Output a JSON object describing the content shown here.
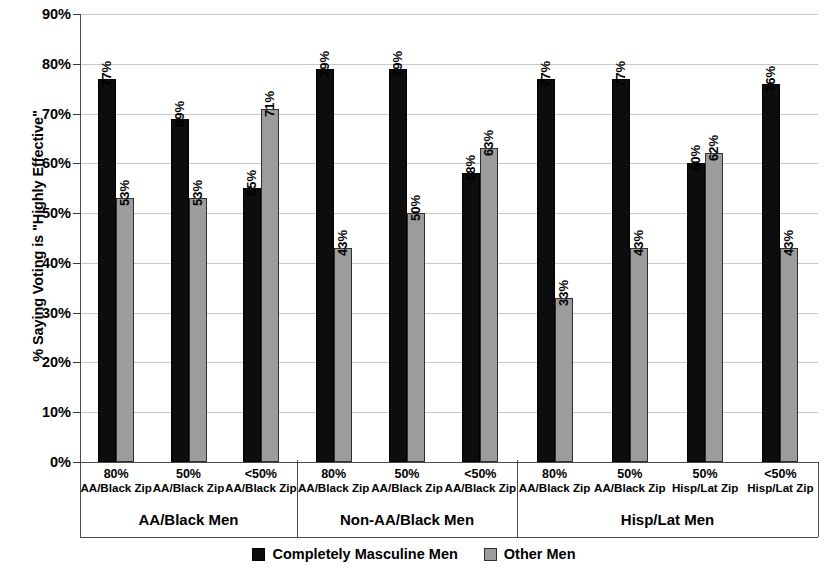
{
  "chart_data": {
    "type": "bar",
    "title": "",
    "xlabel": "",
    "ylabel": "% Saying Voting is \"Highly Effective\"",
    "ylim": [
      0,
      90
    ],
    "ytick_labels": [
      "0%",
      "10%",
      "20%",
      "30%",
      "40%",
      "50%",
      "60%",
      "70%",
      "80%",
      "90%"
    ],
    "ytick_values": [
      0,
      10,
      20,
      30,
      40,
      50,
      60,
      70,
      80,
      90
    ],
    "grid": true,
    "legend_position": "bottom-center",
    "series": [
      {
        "name": "Completely Masculine Men",
        "color": "#0d0d0d",
        "values": [
          77,
          69,
          55,
          79,
          79,
          58,
          77,
          77,
          60,
          76
        ],
        "labels": [
          "77%",
          "69%",
          "55%",
          "79%",
          "79%",
          "58%",
          "77%",
          "77%",
          "60%",
          "76%"
        ]
      },
      {
        "name": "Other Men",
        "color": "#9c9c9c",
        "values": [
          53,
          53,
          71,
          43,
          50,
          63,
          33,
          43,
          62,
          43
        ],
        "labels": [
          "53%",
          "53%",
          "71%",
          "43%",
          "50%",
          "63%",
          "33%",
          "43%",
          "62%",
          "43%"
        ]
      }
    ],
    "categories": [
      {
        "top": "80%",
        "bottom": "AA/Black Zip"
      },
      {
        "top": "50%",
        "bottom": "AA/Black Zip"
      },
      {
        "top": "<50%",
        "bottom": "AA/Black Zip"
      },
      {
        "top": "80%",
        "bottom": "AA/Black Zip"
      },
      {
        "top": "50%",
        "bottom": "AA/Black Zip"
      },
      {
        "top": "<50%",
        "bottom": "AA/Black Zip"
      },
      {
        "top": "80%",
        "bottom": "AA/Black Zip"
      },
      {
        "top": "50%",
        "bottom": "AA/Black Zip"
      },
      {
        "top": "50%",
        "bottom": "Hisp/Lat Zip"
      },
      {
        "top": "<50%",
        "bottom": "Hisp/Lat Zip"
      }
    ],
    "groups": [
      {
        "label": "AA/Black Men",
        "start": 0,
        "count": 3
      },
      {
        "label": "Non-AA/Black Men",
        "start": 3,
        "count": 3
      },
      {
        "label": "Hisp/Lat Men",
        "start": 6,
        "count": 4
      }
    ]
  }
}
